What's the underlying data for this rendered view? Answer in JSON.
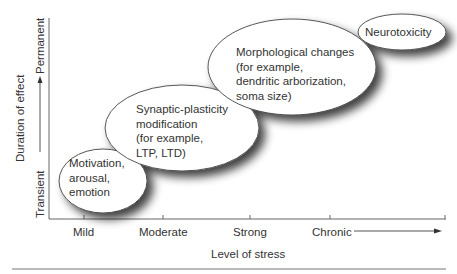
{
  "diagram": {
    "x_axis": {
      "title": "Level of stress",
      "ticks": [
        "Mild",
        "Moderate",
        "Strong",
        "Chronic"
      ]
    },
    "y_axis": {
      "title": "Duration of effect",
      "low_label": "Transient",
      "high_label": "Permanent"
    },
    "bubbles": [
      {
        "id": "motivation",
        "text": "Motivation,\narousal,\nemotion"
      },
      {
        "id": "synaptic",
        "text": "Synaptic-plasticity\nmodification\n(for example,\nLTP, LTD)"
      },
      {
        "id": "morphological",
        "text": "Morphological changes\n(for example,\ndendritic arborization,\nsoma size)"
      },
      {
        "id": "neurotoxicity",
        "text": "Neurotoxicity"
      }
    ],
    "colors": {
      "line": "#555555",
      "bubble_fill": "#ffffff",
      "bubble_stroke": "#444444",
      "shadow": "#222222"
    }
  }
}
